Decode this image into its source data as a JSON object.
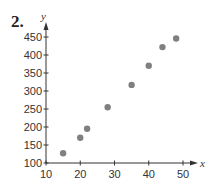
{
  "problem_number": "2.",
  "chart_data": {
    "type": "scatter",
    "title": "",
    "xlabel": "x",
    "ylabel": "y",
    "xlim": [
      10,
      50
    ],
    "ylim": [
      100,
      450
    ],
    "x_ticks": [
      10,
      20,
      30,
      40,
      50
    ],
    "y_ticks": [
      100,
      150,
      200,
      250,
      300,
      350,
      400,
      450
    ],
    "grid": false,
    "legend": null,
    "point_color": "#808080",
    "series": [
      {
        "name": "data",
        "x": [
          15,
          20,
          22,
          28,
          35,
          40,
          44,
          48
        ],
        "y": [
          127,
          170,
          195,
          255,
          317,
          370,
          422,
          446
        ]
      }
    ]
  }
}
